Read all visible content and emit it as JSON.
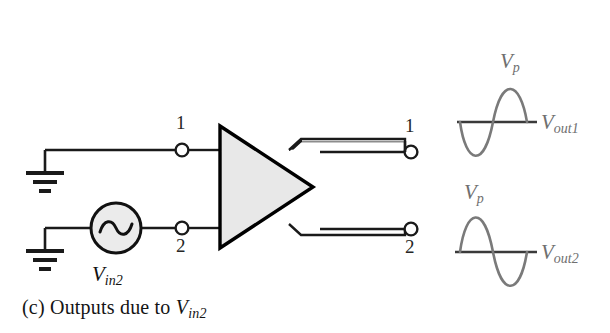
{
  "figure": {
    "caption_prefix": "(c) Outputs due to ",
    "caption_v": "V",
    "caption_sub": "in2",
    "background_color": "#ffffff"
  },
  "colors": {
    "wire": "#1a1a1a",
    "amplifier_fill": "#e8e8e8",
    "amplifier_stroke": "#000000",
    "source_fill": "#ebebeb",
    "source_stroke": "#111111",
    "waveform_curve": "#7a7a7a",
    "waveform_axis": "#3a3a3a",
    "label_text": "#1a1a1a",
    "wave_label_text": "#6f6f6f"
  },
  "inputs": {
    "ground_top": {
      "name": "ground"
    },
    "ground_bottom": {
      "name": "ground"
    },
    "node1_label": "1",
    "node2_label": "2",
    "source": {
      "symbol": "sine",
      "v": "V",
      "sub": "in2"
    }
  },
  "amplifier": {
    "shape": "triangle",
    "name": "differential-amplifier"
  },
  "outputs": {
    "terminal1_label": "1",
    "terminal2_label": "2"
  },
  "waveforms": [
    {
      "id": "vout1",
      "peak_label_v": "V",
      "peak_label_sub": "p",
      "signal_label_v": "V",
      "signal_label_sub": "out1",
      "phase": "negative-first",
      "amplitude": 46,
      "cycles": 1
    },
    {
      "id": "vout2",
      "peak_label_v": "V",
      "peak_label_sub": "p",
      "signal_label_v": "V",
      "signal_label_sub": "out2",
      "phase": "positive-first",
      "amplitude": 46,
      "cycles": 1
    }
  ]
}
